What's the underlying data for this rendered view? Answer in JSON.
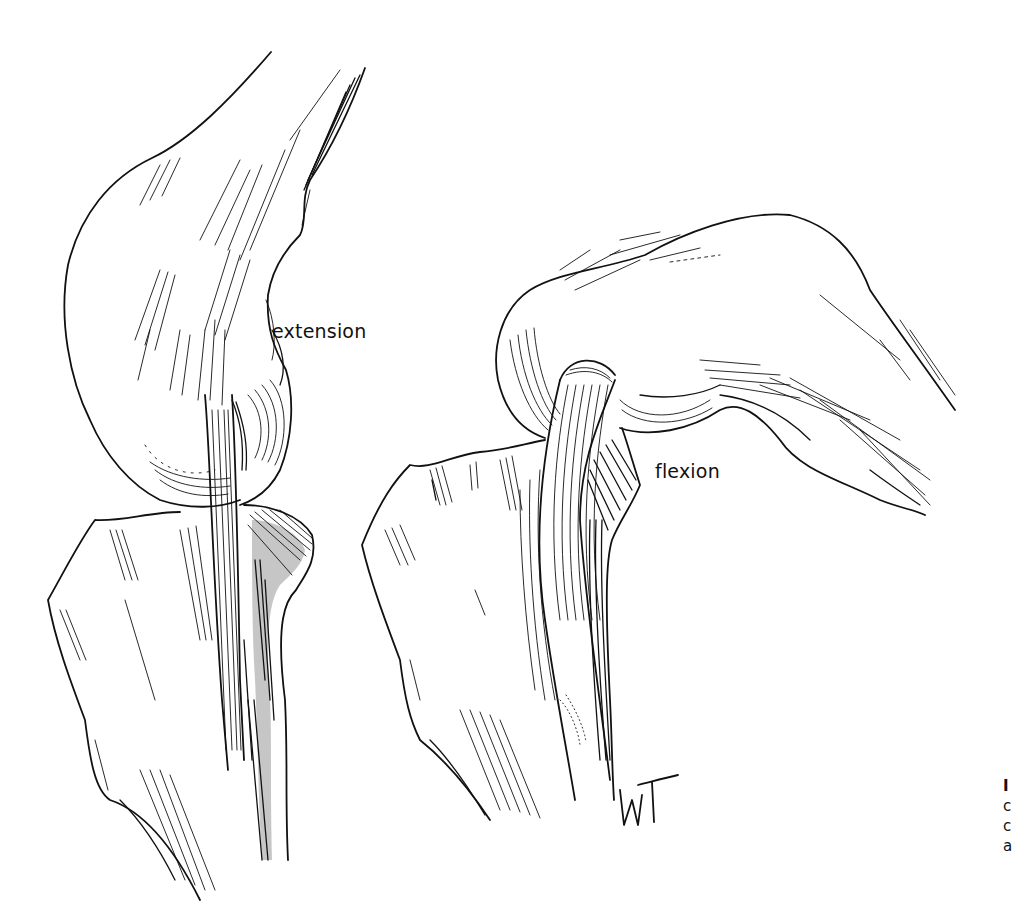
{
  "figure": {
    "type": "anatomical-line-drawing",
    "panels": [
      {
        "id": "left",
        "label": "extension"
      },
      {
        "id": "right",
        "label": "flexion"
      }
    ],
    "signature": "WT",
    "caption_fragment": [
      "I",
      "c",
      "c",
      "a"
    ],
    "colors": {
      "ink": "#111111",
      "background": "#ffffff"
    }
  }
}
